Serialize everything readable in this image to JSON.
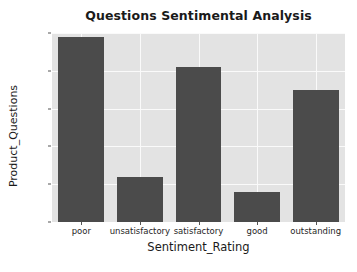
{
  "chart_data": {
    "type": "bar",
    "title": "Questions Sentimental Analysis",
    "xlabel": "Sentiment_Rating",
    "ylabel": "Product_Questions",
    "categories": [
      "poor",
      "unsatisfactory",
      "satisfactory",
      "good",
      "outstanding"
    ],
    "values": [
      49,
      12,
      41,
      8,
      35
    ],
    "ylim": [
      0,
      50
    ],
    "yticks": [
      0,
      10,
      20,
      30,
      40,
      50
    ],
    "ytick_labels": [
      "0",
      "10",
      "20",
      "30",
      "40",
      "50"
    ],
    "grid": true,
    "legend": null,
    "bar_color": "#4b4b4b",
    "plot_background": "#e3e3e3",
    "figure_background": "#ffffff",
    "gridline_color": "#fafafa",
    "text_color": "#262626"
  }
}
